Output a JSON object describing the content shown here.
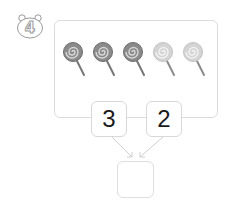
{
  "problem": {
    "number": "4",
    "badge_icon": "bear-head-icon"
  },
  "picture": {
    "object_icon": "lollipop-icon",
    "objects": [
      {
        "shade": "dark",
        "head_color": "#8a8a8a",
        "swirl_color": "#d6d6d6"
      },
      {
        "shade": "dark",
        "head_color": "#8a8a8a",
        "swirl_color": "#d6d6d6"
      },
      {
        "shade": "dark",
        "head_color": "#8a8a8a",
        "swirl_color": "#d6d6d6"
      },
      {
        "shade": "light",
        "head_color": "#d4d4d4",
        "swirl_color": "#f2f2f2"
      },
      {
        "shade": "light",
        "head_color": "#d4d4d4",
        "swirl_color": "#f2f2f2"
      }
    ],
    "total_count": 5
  },
  "number_bond": {
    "part_a": "3",
    "part_b": "2",
    "whole": ""
  },
  "colors": {
    "frame_border": "#dcdcdc",
    "box_border": "#d8d8d8",
    "arrow": "#cfcfcf",
    "number_text": "#1a1a1a",
    "badge_stroke": "#9a9a9a"
  }
}
